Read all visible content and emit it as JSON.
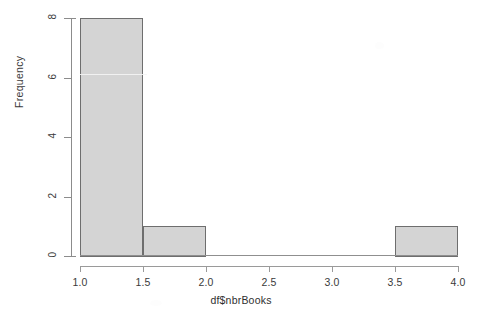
{
  "chart_data": {
    "type": "bar",
    "title": "",
    "subtitle": "",
    "xlabel": "df$nbrBooks",
    "ylabel": "Frequency",
    "xlim": [
      1.0,
      4.0
    ],
    "ylim": [
      0,
      8
    ],
    "grid": false,
    "legend": null,
    "bin_width": 0.5,
    "bin_edges": [
      1.0,
      1.5,
      2.0,
      2.5,
      3.0,
      3.5,
      4.0
    ],
    "categories": [
      "1.0-1.5",
      "1.5-2.0",
      "2.0-2.5",
      "2.5-3.0",
      "3.0-3.5",
      "3.5-4.0"
    ],
    "values": [
      8,
      1,
      0,
      0,
      0,
      1
    ],
    "bars": [
      {
        "label": "1.0-1.5",
        "x0": 1.0,
        "x1": 1.5,
        "value": 8
      },
      {
        "label": "1.5-2.0",
        "x0": 1.5,
        "x1": 2.0,
        "value": 1
      },
      {
        "label": "2.0-2.5",
        "x0": 2.0,
        "x1": 2.5,
        "value": 0
      },
      {
        "label": "2.5-3.0",
        "x0": 2.5,
        "x1": 3.0,
        "value": 0
      },
      {
        "label": "3.0-3.5",
        "x0": 3.0,
        "x1": 3.5,
        "value": 0
      },
      {
        "label": "3.5-4.0",
        "x0": 3.5,
        "x1": 4.0,
        "value": 1
      }
    ],
    "xticks": [
      {
        "value": 1.0,
        "label": "1.0"
      },
      {
        "value": 1.5,
        "label": "1.5"
      },
      {
        "value": 2.0,
        "label": "2.0"
      },
      {
        "value": 2.5,
        "label": "2.5"
      },
      {
        "value": 3.0,
        "label": "3.0"
      },
      {
        "value": 3.5,
        "label": "3.5"
      },
      {
        "value": 4.0,
        "label": "4.0"
      }
    ],
    "yticks": [
      {
        "value": 0,
        "label": "0"
      },
      {
        "value": 2,
        "label": "2"
      },
      {
        "value": 4,
        "label": "4"
      },
      {
        "value": 6,
        "label": "6"
      },
      {
        "value": 8,
        "label": "8"
      }
    ],
    "colors": {
      "bar_fill": "#d4d4d4",
      "bar_border": "#6e6e6e",
      "axis": "#8c8c8c",
      "text": "#3a3a3a",
      "background": "#ffffff"
    }
  }
}
